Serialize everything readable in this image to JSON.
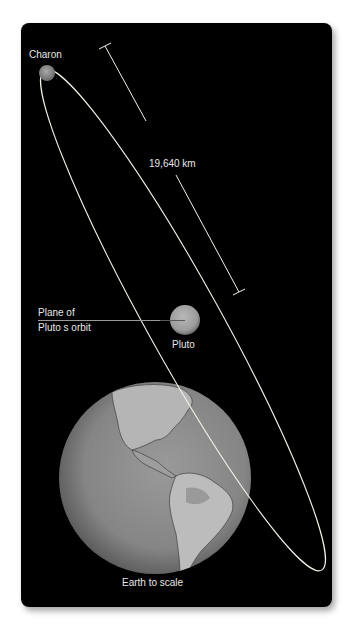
{
  "diagram": {
    "labels": {
      "charon": "Charon",
      "distance": "19,640 km",
      "plane_line1": "Plane of",
      "plane_line2": "Pluto s orbit",
      "pluto": "Pluto",
      "earth": "Earth to scale"
    },
    "colors": {
      "background": "#000000",
      "orbit": "#f2f2e8",
      "text": "#e6e6e6",
      "pluto": "#a6a6a6",
      "charon": "#9a9a9a",
      "earth_ocean": "#8c8c8c",
      "earth_land": "#bdbdbd"
    },
    "bodies": [
      {
        "name": "Charon",
        "cx": 47,
        "cy": 73,
        "r": 8
      },
      {
        "name": "Pluto",
        "cx": 185,
        "cy": 320,
        "r": 15
      },
      {
        "name": "Earth",
        "cx": 155,
        "cy": 478,
        "r": 96
      }
    ],
    "orbit": {
      "cx": 183,
      "cy": 320,
      "rx": 286,
      "ry": 37,
      "rotation_deg": 61
    },
    "dimension": {
      "x1": 105,
      "y1": 46,
      "x2": 239,
      "y2": 292,
      "value": "19,640 km"
    }
  }
}
